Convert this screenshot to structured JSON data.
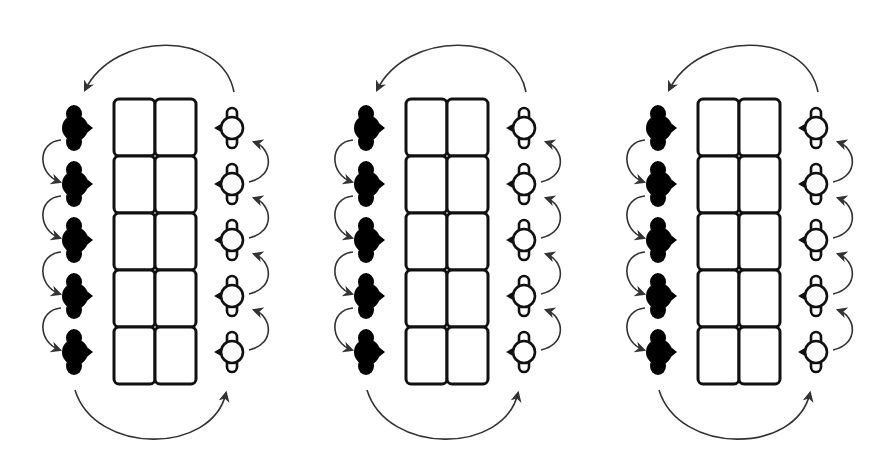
{
  "diagram": {
    "width": 891,
    "height": 473,
    "background": "#ffffff",
    "stroke_color": "#111111",
    "arrow_color": "#333333",
    "panel_count": 3,
    "panel_spacing": 292,
    "panels": [
      {
        "id": "panel-1",
        "offset_x": 0
      },
      {
        "id": "panel-2",
        "offset_x": 292
      },
      {
        "id": "panel-3",
        "offset_x": 584
      }
    ],
    "grid": {
      "x": 114,
      "y": 99,
      "cols": 2,
      "rows": 5,
      "cell_width": 41,
      "cell_height": 57,
      "corner_radius": 5,
      "stroke_width": 3
    },
    "left_tokens": {
      "style": "filled-black",
      "fill": "#000000",
      "center_x": 75,
      "centers_y": [
        128,
        184,
        240,
        296,
        352
      ],
      "direction": "down"
    },
    "right_tokens": {
      "style": "hollow-white",
      "fill": "#ffffff",
      "center_x": 232,
      "centers_y": [
        128,
        184,
        240,
        296,
        352
      ],
      "direction": "up"
    },
    "transfer_arcs": {
      "top": {
        "from": "right-column-top",
        "to": "left-column-top",
        "direction": "right-to-left"
      },
      "bottom": {
        "from": "left-column-bottom",
        "to": "right-column-bottom",
        "direction": "left-to-right"
      }
    }
  }
}
